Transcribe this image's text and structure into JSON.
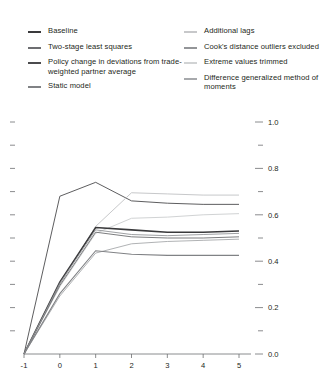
{
  "legend": {
    "left_column": [
      {
        "label": "Baseline",
        "color": "#3a3a3c",
        "swatch_name": "legend-swatch-baseline"
      },
      {
        "label": "Two-stage least squares",
        "color": "#6d6e71",
        "swatch_name": "legend-swatch-two-stage-least-squares"
      },
      {
        "label": "Policy change in deviations from trade-weighted partner average",
        "color": "#4b4b4d",
        "swatch_name": "legend-swatch-policy-change"
      },
      {
        "label": "Static model",
        "color": "#808285",
        "swatch_name": "legend-swatch-static-model"
      }
    ],
    "right_column": [
      {
        "label": "Additional lags",
        "color": "#c7c8ca",
        "swatch_name": "legend-swatch-additional-lags"
      },
      {
        "label": "Cook's distance outliers excluded",
        "color": "#939598",
        "swatch_name": "legend-swatch-cooks-distance"
      },
      {
        "label": "Extreme values trimmed",
        "color": "#d1d3d4",
        "swatch_name": "legend-swatch-extreme-values-trimmed"
      },
      {
        "label": "Difference generalized method of moments",
        "color": "#a7a9ac",
        "swatch_name": "legend-swatch-difference-gmm"
      }
    ]
  },
  "chart_data": {
    "type": "line",
    "title": "",
    "xlabel": "",
    "ylabel": "",
    "x": [
      -1,
      0,
      1,
      2,
      3,
      4,
      5
    ],
    "xlim": [
      -1,
      5
    ],
    "ylim": [
      0.0,
      1.0
    ],
    "x_tick_labels": [
      "-1",
      "0",
      "1",
      "2",
      "3",
      "4",
      "5"
    ],
    "y_tick_labels": [
      "0.0",
      "0.2",
      "0.4",
      "0.6",
      "0.8",
      "1.0"
    ],
    "y_major_ticks": [
      0.0,
      0.2,
      0.4,
      0.6,
      0.8,
      1.0
    ],
    "y_minor_ticks": [
      0.1,
      0.3,
      0.5,
      0.7,
      0.9
    ],
    "grid": false,
    "legend_position": "top",
    "y_axis_side": "right",
    "series": [
      {
        "name": "Policy change in deviations from trade-weighted partner average",
        "color": "#4b4b4d",
        "width": 0.9,
        "values": [
          0.0,
          0.68,
          0.74,
          0.66,
          0.65,
          0.645,
          0.645
        ]
      },
      {
        "name": "Additional lags",
        "color": "#c7c8ca",
        "width": 1.0,
        "values": [
          0.0,
          0.3,
          0.55,
          0.695,
          0.69,
          0.685,
          0.685
        ]
      },
      {
        "name": "Extreme values trimmed",
        "color": "#d1d3d4",
        "width": 1.0,
        "values": [
          0.0,
          0.29,
          0.52,
          0.585,
          0.59,
          0.6,
          0.605
        ]
      },
      {
        "name": "Baseline",
        "color": "#3a3a3c",
        "width": 1.6,
        "values": [
          0.0,
          0.31,
          0.545,
          0.535,
          0.525,
          0.525,
          0.53
        ]
      },
      {
        "name": "Two-stage least squares",
        "color": "#6d6e71",
        "width": 0.9,
        "values": [
          0.0,
          0.295,
          0.525,
          0.505,
          0.5,
          0.5,
          0.505
        ]
      },
      {
        "name": "Cook's distance outliers excluded",
        "color": "#939598",
        "width": 0.9,
        "values": [
          0.0,
          0.305,
          0.535,
          0.515,
          0.51,
          0.515,
          0.52
        ]
      },
      {
        "name": "Difference generalized method of moments",
        "color": "#a7a9ac",
        "width": 0.9,
        "values": [
          0.0,
          0.25,
          0.435,
          0.475,
          0.485,
          0.49,
          0.495
        ]
      },
      {
        "name": "Static model",
        "color": "#808285",
        "width": 1.1,
        "values": [
          0.0,
          0.26,
          0.445,
          0.43,
          0.425,
          0.425,
          0.425
        ]
      }
    ]
  }
}
